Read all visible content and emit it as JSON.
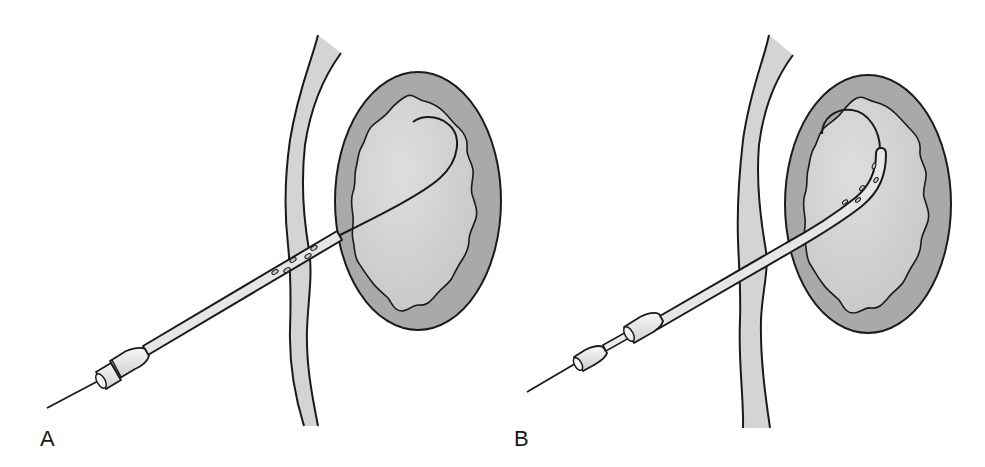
{
  "figure": {
    "panels": [
      {
        "label": "A",
        "content": "Needle with catheter sheath passed through wall; guidewire advanced and coiled inside cavity"
      },
      {
        "label": "B",
        "content": "Catheter advanced over guidewire with pigtail tip curled inside cavity; stylet being withdrawn"
      }
    ]
  },
  "colors": {
    "outline": "#1a1a1a",
    "wall_fill": "#d4d4d4",
    "cavity_outer": "#a9a9a9",
    "cavity_inner": "#d0d0d0",
    "catheter_fill": "#e6e6e6",
    "hub_fill": "#ececec",
    "background": "#ffffff"
  }
}
